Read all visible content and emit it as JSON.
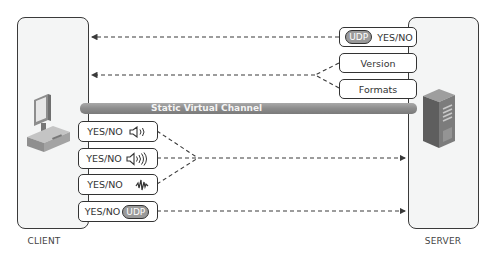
{
  "client": {
    "label": "CLIENT",
    "icon": "desktop-computer-icon"
  },
  "server": {
    "label": "SERVER",
    "icon": "server-tower-icon"
  },
  "channel": {
    "label": "Static Virtual Channel",
    "color": "#8c8c8c"
  },
  "server_messages": [
    {
      "pill": "UDP",
      "text": "YES/NO"
    },
    {
      "text": "Version"
    },
    {
      "text": "Formats"
    }
  ],
  "client_messages": [
    {
      "text": "YES/NO",
      "icon": "speaker-low-volume-icon"
    },
    {
      "text": "YES/NO",
      "icon": "speaker-high-volume-icon"
    },
    {
      "text": "YES/NO",
      "icon": "microphone-waveform-icon"
    },
    {
      "text": "YES/NO",
      "pill": "UDP"
    }
  ],
  "colors": {
    "line": "#3a3a3a",
    "panel": "#f4f5f5",
    "pill": "#9a9a9a"
  }
}
